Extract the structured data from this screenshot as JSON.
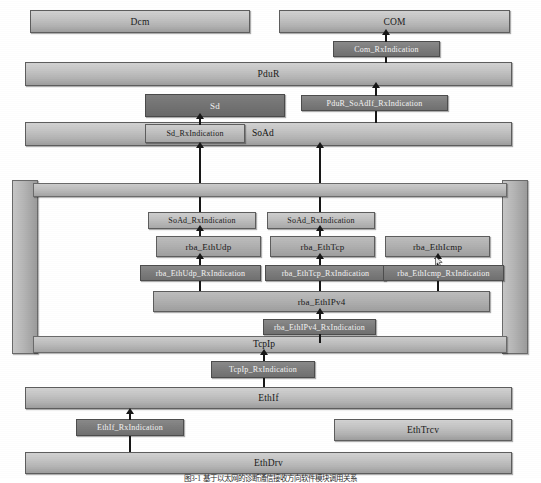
{
  "diagram": {
    "colors": {
      "module_fill_light": "#c4c4c4",
      "module_fill_dark": "#6f6f6f",
      "border": "#5d5d5d",
      "arrow": "#171717",
      "canvas": "#ffffff"
    },
    "layers": {
      "dcm": "Dcm",
      "com": "COM",
      "pdur": "PduR",
      "sd": "Sd",
      "soad": "SoAd",
      "tcpip": "TcpIp",
      "ethif": "EthIf",
      "ethtrcv": "EthTrcv",
      "ethdrv": "EthDrv"
    },
    "apis": {
      "com_rxindication": "Com_RxIndication",
      "pdur_soadif_rxindication": "PduR_SoAdIf_RxIndication",
      "sd_rxindication": "Sd_RxIndication",
      "soad_rxindication_udp": "SoAd_RxIndication",
      "soad_rxindication_tcp": "SoAd_RxIndication",
      "rba_ethudp_rxindication": "rba_EthUdp_RxIndication",
      "rba_ethtcp_rxindication": "rba_EthTcp_RxIndication",
      "rba_ethicmp_rxindication": "rba_EthIcmp_RxIndication",
      "rba_ethipv4_rxindication": "rba_EthIPv4_RxIndication",
      "tcpip_rxindication": "TcpIp_RxIndication",
      "ethif_rxindication": "EthIf_RxIndication"
    },
    "protocol_modules": {
      "rba_ethudp": "rba_EthUdp",
      "rba_ethtcp": "rba_EthTcp",
      "rba_ethicmp": "rba_EthIcmp",
      "rba_ethipv4": "rba_EthIPv4"
    },
    "caption": "图3-1  基于以太网的诊断通信接收方向软件模块调用关系"
  }
}
